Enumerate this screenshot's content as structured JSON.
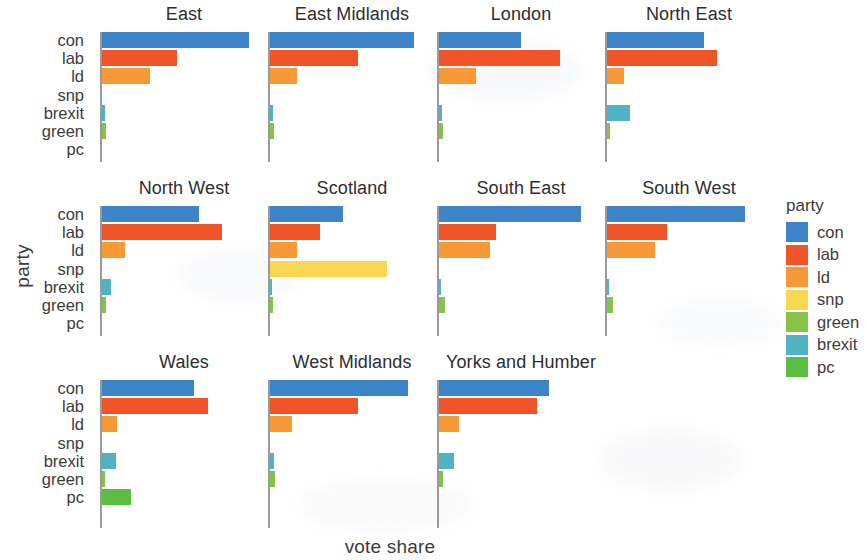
{
  "chart_data": {
    "type": "bar",
    "title": "",
    "xlabel": "vote share",
    "ylabel": "party",
    "orientation": "horizontal",
    "facet_by": "region",
    "grid": false,
    "legend_position": "right",
    "xlim": [
      0,
      0.62
    ],
    "categories": [
      "con",
      "lab",
      "ld",
      "snp",
      "brexit",
      "green",
      "pc"
    ],
    "legend": {
      "title": "party",
      "entries": [
        {
          "label": "con",
          "color": "#3d85c8"
        },
        {
          "label": "lab",
          "color": "#f0552a"
        },
        {
          "label": "ld",
          "color": "#f89938"
        },
        {
          "label": "snp",
          "color": "#fad750"
        },
        {
          "label": "green",
          "color": "#86c247"
        },
        {
          "label": "brexit",
          "color": "#4fb3c4"
        },
        {
          "label": "pc",
          "color": "#5bbd43"
        }
      ]
    },
    "panels": [
      {
        "name": "East",
        "row": 1,
        "col": 1,
        "values": {
          "con": 0.575,
          "lab": 0.295,
          "ld": 0.19,
          "snp": 0.0,
          "brexit": 0.012,
          "green": 0.016,
          "pc": 0.0
        }
      },
      {
        "name": "East Midlands",
        "row": 1,
        "col": 2,
        "values": {
          "con": 0.565,
          "lab": 0.345,
          "ld": 0.105,
          "snp": 0.0,
          "brexit": 0.012,
          "green": 0.015,
          "pc": 0.0
        }
      },
      {
        "name": "London",
        "row": 1,
        "col": 3,
        "values": {
          "con": 0.32,
          "lab": 0.475,
          "ld": 0.145,
          "snp": 0.0,
          "brexit": 0.01,
          "green": 0.015,
          "pc": 0.0
        }
      },
      {
        "name": "North East",
        "row": 1,
        "col": 4,
        "values": {
          "con": 0.38,
          "lab": 0.43,
          "ld": 0.065,
          "snp": 0.0,
          "brexit": 0.09,
          "green": 0.012,
          "pc": 0.0
        }
      },
      {
        "name": "North West",
        "row": 2,
        "col": 1,
        "values": {
          "con": 0.38,
          "lab": 0.47,
          "ld": 0.09,
          "snp": 0.0,
          "brexit": 0.035,
          "green": 0.017,
          "pc": 0.0
        }
      },
      {
        "name": "Scotland",
        "row": 2,
        "col": 2,
        "values": {
          "con": 0.285,
          "lab": 0.195,
          "ld": 0.105,
          "snp": 0.46,
          "brexit": 0.005,
          "green": 0.01,
          "pc": 0.0
        }
      },
      {
        "name": "South East",
        "row": 2,
        "col": 3,
        "values": {
          "con": 0.555,
          "lab": 0.225,
          "ld": 0.2,
          "snp": 0.0,
          "brexit": 0.008,
          "green": 0.022,
          "pc": 0.0
        }
      },
      {
        "name": "South West",
        "row": 2,
        "col": 4,
        "values": {
          "con": 0.54,
          "lab": 0.235,
          "ld": 0.19,
          "snp": 0.0,
          "brexit": 0.008,
          "green": 0.022,
          "pc": 0.0
        }
      },
      {
        "name": "Wales",
        "row": 3,
        "col": 1,
        "values": {
          "con": 0.36,
          "lab": 0.415,
          "ld": 0.06,
          "snp": 0.0,
          "brexit": 0.055,
          "green": 0.012,
          "pc": 0.115
        }
      },
      {
        "name": "West Midlands",
        "row": 3,
        "col": 2,
        "values": {
          "con": 0.54,
          "lab": 0.345,
          "ld": 0.085,
          "snp": 0.0,
          "brexit": 0.014,
          "green": 0.018,
          "pc": 0.0
        }
      },
      {
        "name": "Yorks and Humber",
        "row": 3,
        "col": 3,
        "values": {
          "con": 0.43,
          "lab": 0.385,
          "ld": 0.08,
          "snp": 0.0,
          "brexit": 0.06,
          "green": 0.014,
          "pc": 0.0
        }
      }
    ]
  }
}
